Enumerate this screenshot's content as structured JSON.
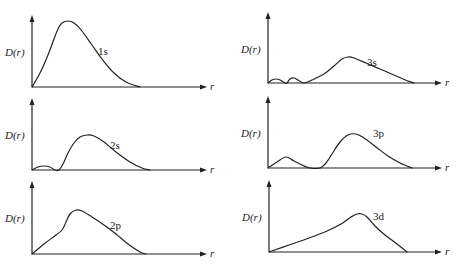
{
  "chart_data": [
    {
      "type": "line",
      "title": "",
      "label": "1s",
      "xlabel": "r",
      "ylabel": "D(r)",
      "origin": [
        32,
        87
      ],
      "y_top": 15,
      "x_end": 207,
      "label_pos": [
        98,
        55
      ],
      "points": [
        [
          0,
          0
        ],
        [
          8,
          14
        ],
        [
          16,
          32
        ],
        [
          22,
          48
        ],
        [
          26,
          58
        ],
        [
          30,
          64
        ],
        [
          36,
          66
        ],
        [
          42,
          64
        ],
        [
          50,
          56
        ],
        [
          60,
          42
        ],
        [
          70,
          28
        ],
        [
          82,
          14
        ],
        [
          94,
          5
        ],
        [
          108,
          0
        ]
      ]
    },
    {
      "type": "line",
      "title": "",
      "label": "2s",
      "xlabel": "r",
      "ylabel": "D(r)",
      "origin": [
        32,
        170
      ],
      "y_top": 98,
      "x_end": 207,
      "label_pos": [
        110,
        149
      ],
      "points": [
        [
          0,
          0
        ],
        [
          6,
          3
        ],
        [
          12,
          4
        ],
        [
          18,
          3
        ],
        [
          23,
          0
        ],
        [
          27,
          0
        ],
        [
          31,
          6
        ],
        [
          36,
          17
        ],
        [
          42,
          27
        ],
        [
          48,
          33
        ],
        [
          55,
          35
        ],
        [
          62,
          34
        ],
        [
          72,
          28
        ],
        [
          84,
          18
        ],
        [
          98,
          8
        ],
        [
          110,
          2
        ],
        [
          118,
          0
        ]
      ]
    },
    {
      "type": "line",
      "title": "",
      "label": "2p",
      "xlabel": "r",
      "ylabel": "D(r)",
      "origin": [
        32,
        254
      ],
      "y_top": 181,
      "x_end": 207,
      "label_pos": [
        110,
        229
      ],
      "points": [
        [
          0,
          0
        ],
        [
          12,
          10
        ],
        [
          24,
          19
        ],
        [
          30,
          24
        ],
        [
          34,
          32
        ],
        [
          38,
          40
        ],
        [
          44,
          44
        ],
        [
          50,
          43
        ],
        [
          60,
          37
        ],
        [
          72,
          29
        ],
        [
          84,
          20
        ],
        [
          96,
          10
        ],
        [
          108,
          2
        ],
        [
          114,
          0
        ]
      ]
    },
    {
      "type": "line",
      "title": "",
      "label": "3s",
      "xlabel": "r",
      "ylabel": "D(r)",
      "origin": [
        268,
        83
      ],
      "y_top": 12,
      "x_end": 442,
      "label_pos": [
        367,
        66
      ],
      "points": [
        [
          0,
          0
        ],
        [
          4,
          3
        ],
        [
          8,
          4
        ],
        [
          12,
          3
        ],
        [
          17,
          0
        ],
        [
          19,
          0
        ],
        [
          22,
          4
        ],
        [
          26,
          5
        ],
        [
          30,
          3
        ],
        [
          36,
          0
        ],
        [
          44,
          3
        ],
        [
          56,
          9
        ],
        [
          66,
          17
        ],
        [
          74,
          24
        ],
        [
          80,
          26
        ],
        [
          86,
          25
        ],
        [
          98,
          20
        ],
        [
          112,
          14
        ],
        [
          126,
          8
        ],
        [
          140,
          2
        ],
        [
          146,
          0
        ]
      ]
    },
    {
      "type": "line",
      "title": "",
      "label": "3p",
      "xlabel": "r",
      "ylabel": "D(r)",
      "origin": [
        268,
        168
      ],
      "y_top": 96,
      "x_end": 442,
      "label_pos": [
        373,
        137
      ],
      "points": [
        [
          0,
          0
        ],
        [
          9,
          6
        ],
        [
          18,
          11
        ],
        [
          26,
          7
        ],
        [
          34,
          3
        ],
        [
          42,
          0
        ],
        [
          52,
          0
        ],
        [
          58,
          5
        ],
        [
          64,
          14
        ],
        [
          72,
          26
        ],
        [
          80,
          33
        ],
        [
          88,
          34
        ],
        [
          96,
          30
        ],
        [
          108,
          21
        ],
        [
          120,
          12
        ],
        [
          132,
          5
        ],
        [
          144,
          0
        ]
      ]
    },
    {
      "type": "line",
      "title": "",
      "label": "3d",
      "xlabel": "r",
      "ylabel": "D(r)",
      "origin": [
        269,
        252
      ],
      "y_top": 180,
      "x_end": 442,
      "label_pos": [
        373,
        220
      ],
      "points": [
        [
          0,
          0
        ],
        [
          20,
          7
        ],
        [
          40,
          14
        ],
        [
          58,
          21
        ],
        [
          72,
          28
        ],
        [
          82,
          35
        ],
        [
          88,
          38
        ],
        [
          93,
          38
        ],
        [
          98,
          35
        ],
        [
          106,
          26
        ],
        [
          116,
          17
        ],
        [
          128,
          8
        ],
        [
          138,
          0
        ]
      ]
    }
  ]
}
